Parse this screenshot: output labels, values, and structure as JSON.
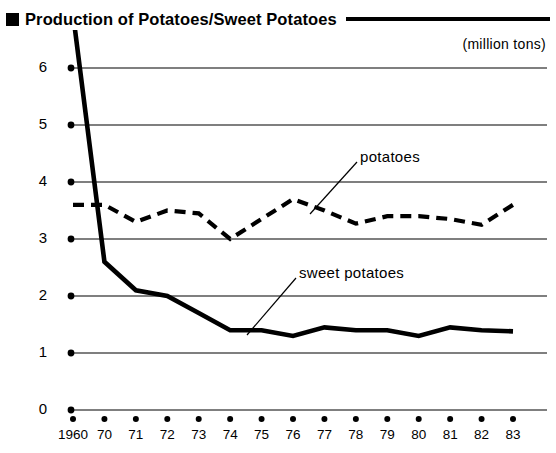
{
  "header": {
    "bullet_icon": "filled-square-icon",
    "title": "Production of Potatoes/Sweet Potatoes",
    "unit_caption": "(million tons)"
  },
  "annotations": {
    "potatoes_label": "potatoes",
    "sweet_potatoes_label": "sweet potatoes"
  },
  "chart_data": {
    "type": "line",
    "title": "Production of Potatoes/Sweet Potatoes",
    "xlabel": "",
    "ylabel": "(million tons)",
    "ylim": [
      0,
      6
    ],
    "yticks": [
      "0",
      "1",
      "2",
      "3",
      "4",
      "5",
      "6"
    ],
    "grid": true,
    "legend": "inline-annotations",
    "categories": [
      "1960",
      "70",
      "71",
      "72",
      "73",
      "74",
      "75",
      "76",
      "77",
      "78",
      "79",
      "80",
      "81",
      "82",
      "83"
    ],
    "series": [
      {
        "name": "potatoes",
        "style": "dashed",
        "color": "#000000",
        "values": [
          3.6,
          3.6,
          3.3,
          3.5,
          3.45,
          3.0,
          3.35,
          3.7,
          3.5,
          3.27,
          3.4,
          3.4,
          3.35,
          3.25,
          3.6
        ]
      },
      {
        "name": "sweet potatoes",
        "style": "solid",
        "color": "#000000",
        "clipped_at_1960": true,
        "values": [
          6.95,
          2.6,
          2.1,
          2.0,
          1.7,
          1.4,
          1.4,
          1.3,
          1.45,
          1.4,
          1.4,
          1.3,
          1.45,
          1.4,
          1.38
        ]
      }
    ]
  }
}
